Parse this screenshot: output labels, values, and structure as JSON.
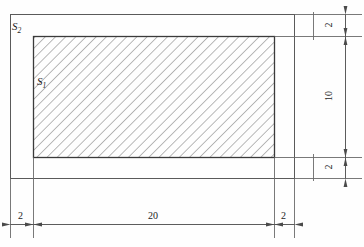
{
  "figure": {
    "regions": [
      {
        "name": "outer-region",
        "label": "S",
        "subscript": "2"
      },
      {
        "name": "inner-hatched-region",
        "label": "S",
        "subscript": "1"
      }
    ],
    "dimensions": {
      "bottom": [
        {
          "name": "left-border-width",
          "value": "2"
        },
        {
          "name": "inner-width",
          "value": "20"
        },
        {
          "name": "right-border-width",
          "value": "2"
        }
      ],
      "right": [
        {
          "name": "top-border-height",
          "value": "2"
        },
        {
          "name": "inner-height",
          "value": "10"
        },
        {
          "name": "bottom-border-height",
          "value": "2"
        }
      ]
    },
    "style": {
      "line_color": "#555555",
      "outline_color": "#3a3a3a",
      "hatch_color": "#8c8c8c",
      "text_color": "#1d1d1d"
    }
  }
}
